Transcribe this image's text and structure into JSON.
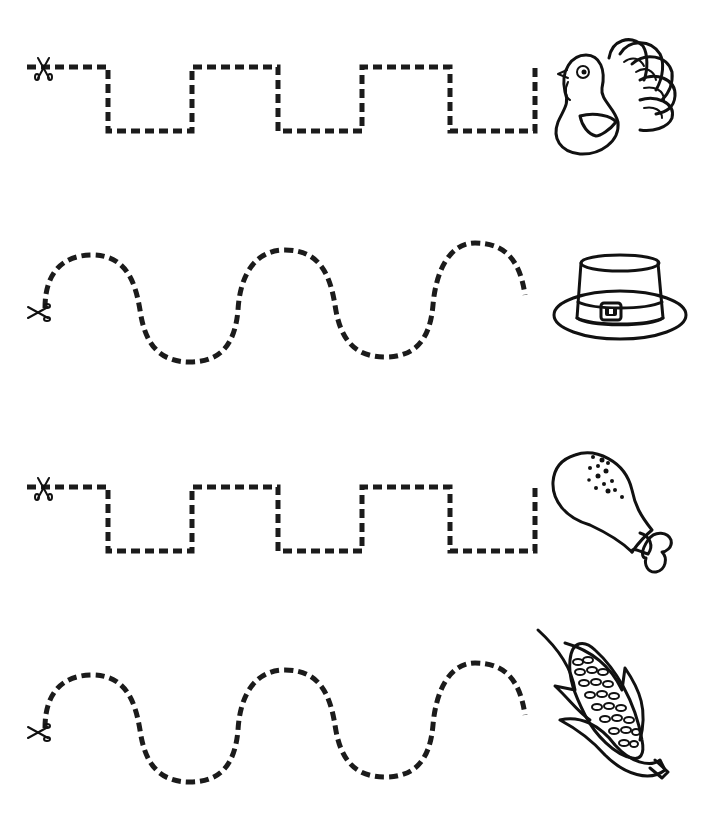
{
  "worksheet": {
    "type": "scissor cutting practice",
    "background": "#ffffff",
    "line_color": "#1b1b1b",
    "rows": [
      {
        "path": "square-wave",
        "start_icon": "scissors-icon",
        "picture": "turkey"
      },
      {
        "path": "curved-wave",
        "start_icon": "scissors-icon",
        "picture": "pilgrim-hat"
      },
      {
        "path": "square-wave",
        "start_icon": "scissors-icon",
        "picture": "turkey-drumstick"
      },
      {
        "path": "curved-wave",
        "start_icon": "scissors-icon",
        "picture": "corn-cob"
      }
    ]
  }
}
